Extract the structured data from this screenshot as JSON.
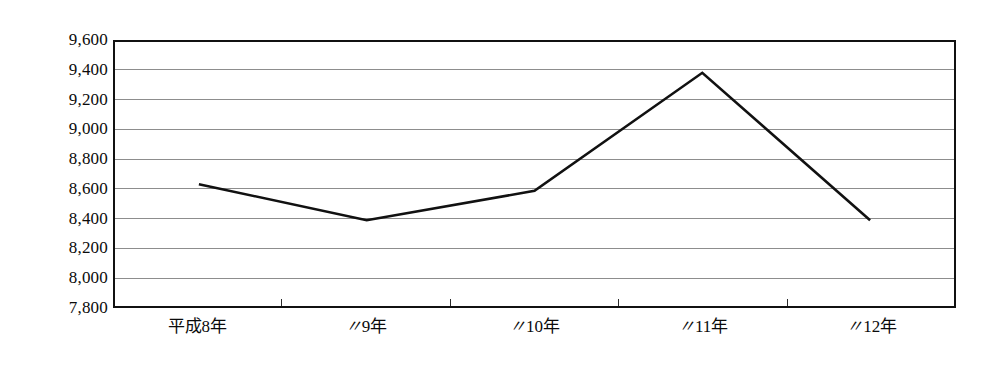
{
  "chart_data": {
    "type": "line",
    "title": "",
    "subtitle": "",
    "xlabel": "",
    "ylabel": "",
    "categories": [
      "平成8年",
      "〃9年",
      "〃10年",
      "〃11年",
      "〃12年"
    ],
    "series": [
      {
        "name": "",
        "values": [
          8630,
          8385,
          8585,
          9390,
          8385
        ]
      }
    ],
    "ylim": [
      7800,
      9600
    ],
    "ytick_step": 200,
    "ytick_labels": [
      "9,600",
      "9,400",
      "9,200",
      "9,000",
      "8,800",
      "8,600",
      "8,400",
      "8,200",
      "8,000",
      "7,800"
    ],
    "ytick_values": [
      9600,
      9400,
      9200,
      9000,
      8800,
      8600,
      8400,
      8200,
      8000,
      7800
    ],
    "grid": true,
    "grid_axis": "y",
    "legend": false,
    "legend_position": "none",
    "markers": false,
    "line_color": "#111111",
    "grid_color": "#8d8d8d",
    "frame_color": "#111111",
    "background_color": "#ffffff",
    "x_ticks_count": 4,
    "annotations": []
  },
  "axis": {
    "y_labels": [
      {
        "text": "9,600"
      },
      {
        "text": "9,400"
      },
      {
        "text": "9,200"
      },
      {
        "text": "9,000"
      },
      {
        "text": "8,800"
      },
      {
        "text": "8,600"
      },
      {
        "text": "8,400"
      },
      {
        "text": "8,200"
      },
      {
        "text": "8,000"
      },
      {
        "text": "7,800"
      }
    ],
    "x_labels": [
      {
        "prefix": "平成",
        "text": "8年"
      },
      {
        "prefix": "〃",
        "text": "9年"
      },
      {
        "prefix": "〃",
        "text": "10年"
      },
      {
        "prefix": "〃",
        "text": "11年"
      },
      {
        "prefix": "〃",
        "text": "12年"
      }
    ]
  }
}
